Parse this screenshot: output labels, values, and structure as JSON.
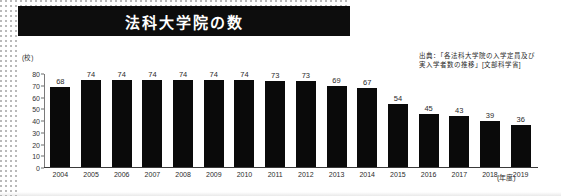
{
  "title": "法科大学院の数",
  "source": {
    "line1": "出典：「各法科大学院の入学定員及び",
    "line2": "実入学者数の推移」[文部科学省]"
  },
  "colors": {
    "bar": "#0a0a0a",
    "title_bar": "#0d0d0d",
    "title_text": "#ffffff",
    "axis": "#3a3a3a",
    "background": "#ffffff"
  },
  "chart_data": {
    "type": "bar",
    "title": "法科大学院の数",
    "xlabel": "(年度)",
    "ylabel": "(校)",
    "ylim": [
      0,
      80
    ],
    "yticks": [
      80,
      70,
      60,
      50,
      40,
      30,
      20,
      10,
      0
    ],
    "grid": false,
    "legend_position": "none",
    "categories": [
      "2004",
      "2005",
      "2006",
      "2007",
      "2008",
      "2009",
      "2010",
      "2011",
      "2012",
      "2013",
      "2014",
      "2015",
      "2016",
      "2017",
      "2018",
      "2019"
    ],
    "values": [
      68,
      74,
      74,
      74,
      74,
      74,
      74,
      73,
      73,
      69,
      67,
      54,
      45,
      43,
      39,
      36
    ],
    "annotations": [
      "出典：「各法科大学院の入学定員及び",
      "実入学者数の推移」[文部科学省]"
    ]
  }
}
